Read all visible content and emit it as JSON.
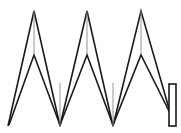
{
  "figure": {
    "background_color": "#ffffff",
    "stroke_color": "#1a1a1a",
    "inner_stroke_color": "#8a8a8a",
    "canvas": {
      "width": 181,
      "height": 133
    }
  },
  "chart_data": {
    "type": "line",
    "title": "",
    "subtitle": "",
    "xlabel": "",
    "ylabel": "",
    "grid": false,
    "legend": null,
    "xlim": [
      0,
      181
    ],
    "ylim": [
      0,
      133
    ],
    "annotations": [],
    "series": [
      {
        "name": "outer-zigzag",
        "closed": false,
        "points": [
          [
            8,
            126
          ],
          [
            34,
            11
          ],
          [
            60,
            126
          ],
          [
            87,
            11
          ],
          [
            113,
            126
          ],
          [
            141,
            11
          ],
          [
            174,
            126
          ]
        ]
      },
      {
        "name": "inner-zigzag",
        "closed": false,
        "points": [
          [
            9,
            125
          ],
          [
            34,
            55
          ],
          [
            60,
            125
          ],
          [
            87,
            55
          ],
          [
            113,
            125
          ],
          [
            141,
            55
          ],
          [
            170,
            113
          ]
        ]
      },
      {
        "name": "connector-peak-1",
        "closed": false,
        "points": [
          [
            34,
            11
          ],
          [
            34,
            55
          ]
        ]
      },
      {
        "name": "connector-peak-2",
        "closed": false,
        "points": [
          [
            87,
            11
          ],
          [
            87,
            55
          ]
        ]
      },
      {
        "name": "connector-peak-3",
        "closed": false,
        "points": [
          [
            141,
            11
          ],
          [
            141,
            55
          ]
        ]
      },
      {
        "name": "connector-valley-1",
        "closed": false,
        "points": [
          [
            60,
            83
          ],
          [
            60,
            126
          ]
        ]
      },
      {
        "name": "connector-valley-2",
        "closed": false,
        "points": [
          [
            113,
            83
          ],
          [
            113,
            126
          ]
        ]
      }
    ],
    "shapes": [
      {
        "name": "end-cap-rectangle",
        "type": "rect",
        "x": 169,
        "y": 84,
        "width": 7,
        "height": 42
      }
    ]
  }
}
